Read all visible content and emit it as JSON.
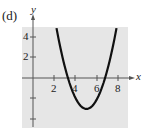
{
  "figure_label": "(d)",
  "chart_data": {
    "type": "line",
    "title": "",
    "xlabel": "x",
    "ylabel": "y",
    "function": "y = (x - 5)^2 - 3",
    "xlim": [
      -1,
      9
    ],
    "ylim": [
      -5,
      5
    ],
    "x_ticks": [
      2,
      4,
      6,
      8
    ],
    "y_ticks": [
      -4,
      -2,
      2,
      4
    ],
    "x_tick_labels": [
      "2",
      "4",
      "6",
      "8"
    ],
    "y_tick_labels": [
      "4",
      "2"
    ],
    "grid": false,
    "background": "#e6e6e6",
    "series": [
      {
        "name": "parabola",
        "x": [
          2.2,
          3,
          3.27,
          4,
          5,
          6,
          6.73,
          7,
          7.8
        ],
        "y": [
          4.84,
          1,
          0,
          -2,
          -3,
          -2,
          0,
          1,
          4.84
        ]
      }
    ],
    "vertex": [
      5,
      -3
    ]
  }
}
